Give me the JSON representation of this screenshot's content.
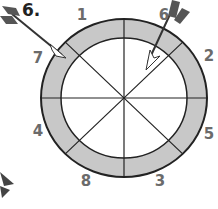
{
  "problem": {
    "number_label": "6."
  },
  "dartboard": {
    "center": [
      124,
      98
    ],
    "outer_radius": [
      83,
      79
    ],
    "inner_radius": [
      63,
      60
    ],
    "ring_color": "#c8c8c8",
    "inner_color": "#ffffff",
    "line_color": "#222222",
    "segments": 8,
    "ring_labels": [
      {
        "value": "1",
        "x": 82,
        "y": 15
      },
      {
        "value": "6",
        "x": 164,
        "y": 15
      },
      {
        "value": "2",
        "x": 209,
        "y": 56
      },
      {
        "value": "5",
        "x": 209,
        "y": 134
      },
      {
        "value": "3",
        "x": 160,
        "y": 181
      },
      {
        "value": "8",
        "x": 86,
        "y": 181
      },
      {
        "value": "4",
        "x": 38,
        "y": 131
      },
      {
        "value": "7",
        "x": 38,
        "y": 58
      }
    ]
  },
  "darts": [
    {
      "name": "dart-upper-left",
      "lands_in": "7"
    },
    {
      "name": "dart-upper-right",
      "lands_in": "6"
    },
    {
      "name": "dart-lower-left",
      "lands_in": "off-board"
    }
  ]
}
